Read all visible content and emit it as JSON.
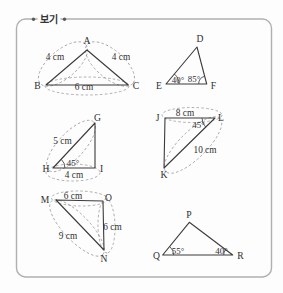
{
  "legend_box": {
    "title": "보기"
  },
  "colors": {
    "box_border": "#b0b0b0",
    "triangle_line": "#3b3b3b",
    "dashed_mark": "#9a9a9a",
    "text": "#2e2e2e"
  },
  "figures": [
    {
      "name": "ABC",
      "vertex": [
        "A",
        "B",
        "C"
      ],
      "mark": [
        "4 cm",
        "4 cm",
        "6 cm"
      ]
    },
    {
      "name": "DEF",
      "vertex": [
        "D",
        "E",
        "F"
      ],
      "mark": [
        "40°",
        "85°"
      ]
    },
    {
      "name": "GHI",
      "vertex": [
        "G",
        "H",
        "I"
      ],
      "mark": [
        "5 cm",
        "45°",
        "4 cm"
      ]
    },
    {
      "name": "JKL",
      "vertex": [
        "J",
        "L",
        "K"
      ],
      "mark": [
        "8 cm",
        "45°",
        "10 cm"
      ]
    },
    {
      "name": "MNO",
      "vertex": [
        "M",
        "O",
        "N"
      ],
      "mark": [
        "6 cm",
        "9 cm",
        "6 cm"
      ]
    },
    {
      "name": "PQR",
      "vertex": [
        "P",
        "Q",
        "R"
      ],
      "mark": [
        "55°",
        "40°"
      ]
    }
  ]
}
